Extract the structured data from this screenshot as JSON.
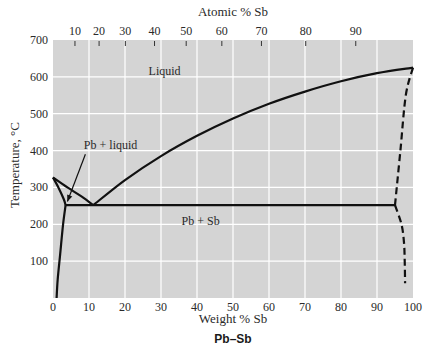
{
  "chart_data": {
    "type": "line",
    "title": "Pb–Sb",
    "xlabel": "Weight % Sb",
    "ylabel": "Temperature, °C",
    "top_axis_label": "Atomic % Sb",
    "xlim": [
      0,
      100
    ],
    "ylim": [
      0,
      700
    ],
    "grid": true,
    "x_ticks": [
      0,
      10,
      20,
      30,
      40,
      50,
      60,
      70,
      80,
      90,
      100
    ],
    "y_ticks": [
      100,
      200,
      300,
      400,
      500,
      600,
      700
    ],
    "top_ticks": [
      {
        "atomic": 10,
        "weight": 6.1
      },
      {
        "atomic": 20,
        "weight": 12.8
      },
      {
        "atomic": 30,
        "weight": 20.1
      },
      {
        "atomic": 40,
        "weight": 28.2
      },
      {
        "atomic": 50,
        "weight": 37.0
      },
      {
        "atomic": 60,
        "weight": 46.9
      },
      {
        "atomic": 70,
        "weight": 57.9
      },
      {
        "atomic": 80,
        "weight": 70.2
      },
      {
        "atomic": 90,
        "weight": 84.1
      }
    ],
    "series": [
      {
        "name": "liquidus-left",
        "style": "solid",
        "points": [
          [
            0,
            327
          ],
          [
            4,
            300
          ],
          [
            8,
            275
          ],
          [
            11.2,
            252
          ]
        ]
      },
      {
        "name": "liquidus-right",
        "style": "solid",
        "points": [
          [
            11.2,
            252
          ],
          [
            20,
            320
          ],
          [
            30,
            385
          ],
          [
            40,
            440
          ],
          [
            50,
            487
          ],
          [
            60,
            527
          ],
          [
            70,
            560
          ],
          [
            80,
            588
          ],
          [
            90,
            610
          ],
          [
            100,
            625
          ]
        ]
      },
      {
        "name": "solidus-Pb",
        "style": "solid",
        "points": [
          [
            0,
            327
          ],
          [
            1.5,
            300
          ],
          [
            3,
            268
          ],
          [
            3.5,
            252
          ]
        ]
      },
      {
        "name": "solvus-Pb",
        "style": "solid",
        "points": [
          [
            3.5,
            252
          ],
          [
            2.8,
            200
          ],
          [
            2,
            120
          ],
          [
            1.3,
            50
          ],
          [
            1,
            0
          ]
        ]
      },
      {
        "name": "eutectic-isotherm",
        "style": "solid",
        "points": [
          [
            3.5,
            252
          ],
          [
            95,
            252
          ]
        ]
      },
      {
        "name": "solidus-Sb",
        "style": "dashed",
        "points": [
          [
            95,
            252
          ],
          [
            96.5,
            400
          ],
          [
            98,
            550
          ],
          [
            100,
            625
          ]
        ]
      },
      {
        "name": "solvus-Sb",
        "style": "dashed",
        "points": [
          [
            95,
            252
          ],
          [
            96.8,
            200
          ],
          [
            97.5,
            150
          ],
          [
            97.7,
            100
          ],
          [
            97.8,
            40
          ]
        ]
      }
    ],
    "annotations": [
      {
        "text": "Liquid",
        "x": 31,
        "y": 605
      },
      {
        "text": "Pb + liquid",
        "x": 16,
        "y": 403
      },
      {
        "text": "Pb + Sb",
        "x": 41,
        "y": 197
      }
    ],
    "arrow": {
      "from": [
        9,
        390
      ],
      "to": [
        4,
        262
      ]
    }
  },
  "colors": {
    "plot_bg": "#d4d4d4",
    "grid": "#ffffff",
    "curve": "#111111",
    "text": "#2a2a2a"
  }
}
